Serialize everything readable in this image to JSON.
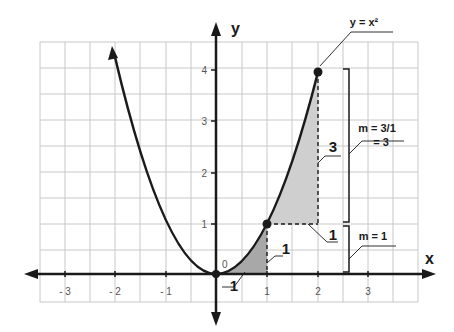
{
  "colors": {
    "grid": "#c8c8c8",
    "axis": "#1a1a1a",
    "curve": "#1a1a1a",
    "shade": "#cfcfcf",
    "shade_dark": "#a8a8a8"
  },
  "axes": {
    "x_label": "x",
    "y_label": "y",
    "origin_label": "0",
    "x_ticks": [
      {
        "value": -3,
        "label": "- 3"
      },
      {
        "value": -2,
        "label": "- 2"
      },
      {
        "value": -1,
        "label": "- 1"
      },
      {
        "value": 1,
        "label": "1"
      },
      {
        "value": 2,
        "label": "2"
      },
      {
        "value": 3,
        "label": "3"
      }
    ],
    "y_ticks": [
      {
        "value": 1,
        "label": "1"
      },
      {
        "value": 2,
        "label": "2"
      },
      {
        "value": 3,
        "label": "3"
      },
      {
        "value": 4,
        "label": "4"
      }
    ]
  },
  "curve": {
    "equation_label": "y = x²",
    "points": [
      {
        "x": 0,
        "y": 0
      },
      {
        "x": 1,
        "y": 1
      },
      {
        "x": 2,
        "y": 4
      }
    ]
  },
  "annotations": {
    "run_lower": "1",
    "rise_lower": "1",
    "run_upper": "1",
    "rise_upper": "3",
    "slope_upper_line1": "m = 3/1",
    "slope_upper_line2": "= 3",
    "slope_lower": "m = 1"
  }
}
